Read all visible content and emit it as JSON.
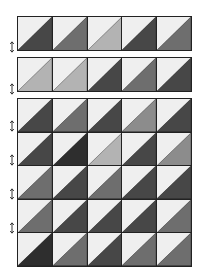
{
  "diagram": {
    "title": "",
    "shades": {
      "light_top": "#efefef",
      "very_dark": "#2e2e2e",
      "dark": "#474747",
      "medium": "#6e6e6e",
      "medium_light": "#8c8c8c",
      "light_gray": "#b3b3b3"
    },
    "strips": [
      {
        "name": "strip-1",
        "tiles": [
          "dark",
          "medium",
          "light_gray",
          "dark",
          "medium"
        ]
      },
      {
        "name": "strip-2",
        "tiles": [
          "light_gray",
          "light_gray",
          "dark",
          "medium",
          "dark"
        ]
      }
    ],
    "main_block": {
      "rows": [
        [
          "dark",
          "medium",
          "dark",
          "medium_light",
          "dark"
        ],
        [
          "dark",
          "very_dark",
          "light_gray",
          "dark",
          "medium_light"
        ],
        [
          "medium",
          "dark",
          "medium",
          "dark",
          "dark"
        ],
        [
          "medium",
          "dark",
          "dark",
          "dark",
          "medium"
        ],
        [
          "very_dark",
          "medium",
          "dark",
          "medium",
          "medium"
        ]
      ]
    },
    "arrows": [
      {
        "y": 47,
        "direction": "up-down"
      },
      {
        "y": 89,
        "direction": "up-down"
      },
      {
        "y": 126,
        "direction": "up-down"
      },
      {
        "y": 160,
        "direction": "up-down"
      },
      {
        "y": 194,
        "direction": "up-down"
      },
      {
        "y": 228,
        "direction": "up-down"
      }
    ]
  }
}
